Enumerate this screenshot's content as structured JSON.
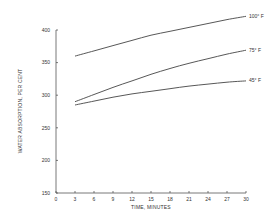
{
  "chart_data": {
    "type": "line",
    "title": "",
    "xlabel": "TIME, MINUTES",
    "ylabel": "WATER ABSORPTION, PER CENT",
    "xlim": [
      0,
      30
    ],
    "ylim": [
      150,
      400
    ],
    "x_ticks": [
      "0",
      "3",
      "6",
      "9",
      "12",
      "15",
      "18",
      "21",
      "24",
      "27",
      "30"
    ],
    "y_ticks": [
      "150",
      "200",
      "250",
      "300",
      "350",
      "400"
    ],
    "grid": false,
    "legend_position": "inline-right",
    "x": [
      3,
      6,
      9,
      12,
      15,
      18,
      21,
      24,
      27,
      30
    ],
    "series": [
      {
        "name": "100° F",
        "values": [
          360,
          368,
          376,
          384,
          392,
          398,
          404,
          410,
          416,
          421
        ]
      },
      {
        "name": "75° F",
        "values": [
          290,
          301,
          312,
          322,
          332,
          341,
          349,
          356,
          363,
          369
        ]
      },
      {
        "name": "45° F",
        "values": [
          285,
          291,
          297,
          302,
          306,
          310,
          314,
          317,
          320,
          322
        ]
      }
    ]
  }
}
